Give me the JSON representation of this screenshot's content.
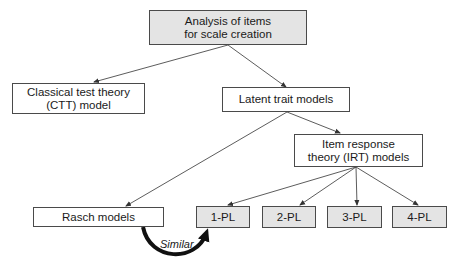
{
  "diagram": {
    "nodes": {
      "root": {
        "label": "Analysis of items\nfor scale creation"
      },
      "ctt": {
        "label": "Classical test theory\n(CTT) model"
      },
      "latent": {
        "label": "Latent trait models"
      },
      "irt": {
        "label": "Item response\ntheory (IRT) models"
      },
      "rasch": {
        "label": "Rasch models"
      },
      "pl1": {
        "label": "1-PL"
      },
      "pl2": {
        "label": "2-PL"
      },
      "pl3": {
        "label": "3-PL"
      },
      "pl4": {
        "label": "4-PL"
      }
    },
    "edges": [
      {
        "from": "root",
        "to": "ctt"
      },
      {
        "from": "root",
        "to": "latent"
      },
      {
        "from": "latent",
        "to": "rasch"
      },
      {
        "from": "latent",
        "to": "irt"
      },
      {
        "from": "irt",
        "to": "pl1"
      },
      {
        "from": "irt",
        "to": "pl2"
      },
      {
        "from": "irt",
        "to": "pl3"
      },
      {
        "from": "irt",
        "to": "pl4"
      }
    ],
    "relation": {
      "from": "rasch",
      "to": "pl1",
      "label": "Similar"
    },
    "colors": {
      "gray_fill": "#e4e4e4",
      "line": "#4a4a4a",
      "curve_arrow": "#111111"
    }
  }
}
